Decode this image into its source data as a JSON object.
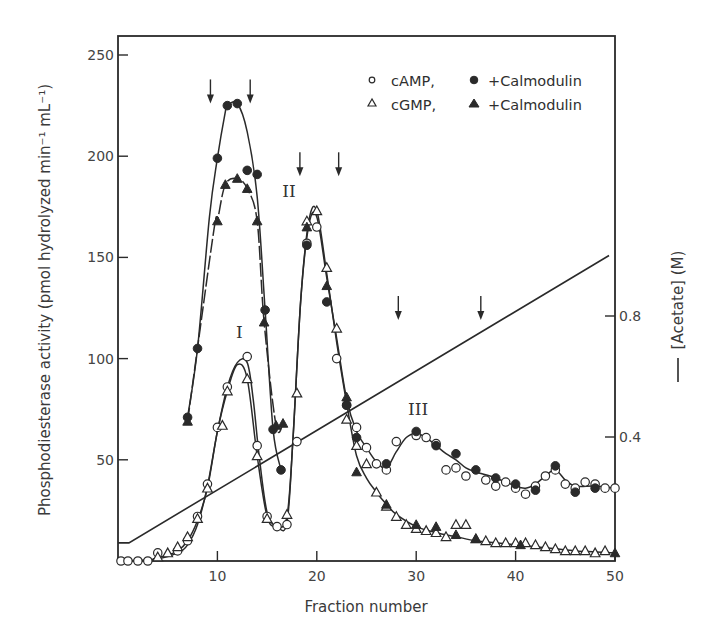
{
  "chart_data": {
    "type": "scatter",
    "title": "",
    "xlabel": "Fraction number",
    "ylabel": "Phosphodiesterase activity (pmol hydrolyzed min⁻¹ mL⁻¹)",
    "y2label": "[Acetate] (M)",
    "xlim": [
      0,
      50
    ],
    "ylim": [
      0,
      260
    ],
    "y2lim": [
      0,
      1.03
    ],
    "grid": false,
    "x_ticks": [
      10,
      20,
      30,
      40,
      50
    ],
    "x_tick_labels": [
      "10",
      "20",
      "30",
      "40",
      "50"
    ],
    "y_ticks": [
      50,
      100,
      150,
      200,
      250
    ],
    "y_tick_labels": [
      "50",
      "100",
      "150",
      "200",
      "250"
    ],
    "y2_ticks": [
      0.4,
      0.8
    ],
    "y2_tick_labels": [
      "0.4",
      "0.8"
    ],
    "legend": {
      "placement": "top-right",
      "rows": [
        {
          "open_symbol": "circle",
          "open_label": "cAMP,",
          "filled_symbol": "circle",
          "filled_label": "+Calmodulin"
        },
        {
          "open_symbol": "triangle",
          "open_label": "cGMP,",
          "filled_symbol": "triangle",
          "filled_label": "+Calmodulin"
        }
      ]
    },
    "peak_labels": [
      {
        "text": "I",
        "x": 12.2,
        "y": 110
      },
      {
        "text": "II",
        "x": 17.2,
        "y": 180
      },
      {
        "text": "III",
        "x": 30.2,
        "y": 72
      }
    ],
    "pooling_arrows": [
      {
        "x": 9.3,
        "y": 232
      },
      {
        "x": 13.3,
        "y": 232
      },
      {
        "x": 18.3,
        "y": 196
      },
      {
        "x": 22.2,
        "y": 196
      },
      {
        "x": 28.2,
        "y": 125
      },
      {
        "x": 36.5,
        "y": 125
      }
    ],
    "series": [
      {
        "name": "cAMP",
        "marker": "circle",
        "filled": false,
        "points": [
          [
            0.3,
            0
          ],
          [
            1,
            0
          ],
          [
            2,
            0
          ],
          [
            3,
            0
          ],
          [
            4,
            4
          ],
          [
            6,
            5
          ],
          [
            7,
            10
          ],
          [
            8,
            22
          ],
          [
            9,
            38
          ],
          [
            10,
            66
          ],
          [
            11,
            86
          ],
          [
            13,
            101
          ],
          [
            14,
            57
          ],
          [
            15,
            22
          ],
          [
            16,
            17
          ],
          [
            17,
            18
          ],
          [
            18,
            59
          ],
          [
            19,
            157
          ],
          [
            20,
            165
          ],
          [
            22,
            100
          ],
          [
            23,
            77
          ],
          [
            24,
            66
          ],
          [
            25,
            56
          ],
          [
            26,
            48
          ],
          [
            27,
            45
          ],
          [
            28,
            59
          ],
          [
            30,
            62
          ],
          [
            31,
            61
          ],
          [
            32,
            58
          ],
          [
            33,
            45
          ],
          [
            34,
            46
          ],
          [
            35,
            42
          ],
          [
            37,
            40
          ],
          [
            38,
            37
          ],
          [
            39,
            39
          ],
          [
            40,
            36
          ],
          [
            41,
            33
          ],
          [
            42,
            37
          ],
          [
            43,
            42
          ],
          [
            44,
            45
          ],
          [
            45,
            38
          ],
          [
            46,
            36
          ],
          [
            47,
            39
          ],
          [
            48,
            38
          ],
          [
            49,
            36
          ],
          [
            50,
            36
          ]
        ]
      },
      {
        "name": "cAMP + Calmodulin",
        "marker": "circle",
        "filled": true,
        "points": [
          [
            7,
            71
          ],
          [
            8,
            105
          ],
          [
            10,
            199
          ],
          [
            11,
            225
          ],
          [
            12,
            226
          ],
          [
            13,
            193
          ],
          [
            14,
            191
          ],
          [
            14.8,
            124
          ],
          [
            15.6,
            65
          ],
          [
            16.4,
            45
          ],
          [
            19,
            156
          ],
          [
            21,
            128
          ],
          [
            23,
            77
          ],
          [
            24,
            61
          ],
          [
            27,
            48
          ],
          [
            30,
            64
          ],
          [
            32,
            57
          ],
          [
            34,
            53
          ],
          [
            36,
            45
          ],
          [
            38,
            41
          ],
          [
            40,
            38
          ],
          [
            42,
            35
          ],
          [
            44,
            47
          ],
          [
            46,
            34
          ],
          [
            48,
            36
          ]
        ]
      },
      {
        "name": "cGMP",
        "marker": "triangle",
        "filled": false,
        "points": [
          [
            4,
            2
          ],
          [
            5,
            4
          ],
          [
            6,
            7
          ],
          [
            7,
            12
          ],
          [
            8,
            21
          ],
          [
            9,
            36
          ],
          [
            10.5,
            67
          ],
          [
            11,
            84
          ],
          [
            13,
            90
          ],
          [
            14,
            52
          ],
          [
            15,
            21
          ],
          [
            17,
            23
          ],
          [
            18,
            83
          ],
          [
            19,
            168
          ],
          [
            20,
            173
          ],
          [
            21,
            145
          ],
          [
            22,
            115
          ],
          [
            23,
            70
          ],
          [
            24,
            57
          ],
          [
            25,
            48
          ],
          [
            26,
            34
          ],
          [
            27,
            27
          ],
          [
            28,
            22
          ],
          [
            29,
            18
          ],
          [
            30,
            16
          ],
          [
            31,
            15
          ],
          [
            32,
            14
          ],
          [
            33,
            12
          ],
          [
            34,
            18
          ],
          [
            35,
            18
          ],
          [
            36,
            11
          ],
          [
            37,
            10
          ],
          [
            38,
            9
          ],
          [
            39,
            9
          ],
          [
            40,
            9
          ],
          [
            41,
            9
          ],
          [
            42,
            8
          ],
          [
            43,
            7
          ],
          [
            44,
            6
          ],
          [
            45,
            5
          ],
          [
            46,
            5
          ],
          [
            47,
            5
          ],
          [
            48,
            4
          ],
          [
            49,
            5
          ]
        ]
      },
      {
        "name": "cGMP + Calmodulin",
        "marker": "triangle",
        "filled": true,
        "points": [
          [
            7,
            69
          ],
          [
            10,
            168
          ],
          [
            10.8,
            186
          ],
          [
            12,
            189
          ],
          [
            13,
            184
          ],
          [
            14,
            168
          ],
          [
            14.7,
            118
          ],
          [
            15.9,
            67
          ],
          [
            16.6,
            68
          ],
          [
            19,
            165
          ],
          [
            21,
            136
          ],
          [
            23,
            81
          ],
          [
            24,
            44
          ],
          [
            27,
            28
          ],
          [
            30,
            18
          ],
          [
            32,
            17
          ],
          [
            34,
            13
          ],
          [
            36,
            11
          ],
          [
            40.5,
            8
          ],
          [
            50,
            4
          ]
        ]
      }
    ],
    "curves": {
      "camp": [
        [
          0,
          0
        ],
        [
          4,
          1
        ],
        [
          6,
          4
        ],
        [
          7,
          8
        ],
        [
          8,
          18
        ],
        [
          9,
          37
        ],
        [
          10,
          64
        ],
        [
          11,
          86
        ],
        [
          12,
          98
        ],
        [
          13,
          98
        ],
        [
          13.6,
          80
        ],
        [
          14.2,
          52
        ],
        [
          15,
          24
        ],
        [
          16,
          17
        ],
        [
          17,
          19
        ],
        [
          17.6,
          60
        ],
        [
          18.4,
          130
        ],
        [
          19.2,
          166
        ],
        [
          20,
          170
        ],
        [
          21,
          140
        ],
        [
          22,
          110
        ],
        [
          23,
          80
        ],
        [
          24,
          64
        ],
        [
          25,
          56
        ],
        [
          26,
          49
        ],
        [
          27,
          46
        ],
        [
          28,
          54
        ],
        [
          29,
          61
        ],
        [
          30,
          63
        ],
        [
          31,
          61
        ],
        [
          32,
          57
        ],
        [
          33,
          53
        ],
        [
          34,
          50
        ],
        [
          35,
          46
        ],
        [
          36,
          44
        ],
        [
          38,
          41
        ],
        [
          40,
          37
        ],
        [
          41,
          36
        ],
        [
          42,
          38
        ],
        [
          43,
          42
        ],
        [
          44,
          45
        ],
        [
          45,
          40
        ],
        [
          46,
          37
        ],
        [
          48,
          37
        ],
        [
          50,
          36
        ]
      ],
      "cgmp": [
        [
          3.5,
          1
        ],
        [
          5,
          3
        ],
        [
          6,
          5
        ],
        [
          7,
          10
        ],
        [
          8,
          20
        ],
        [
          9,
          36
        ],
        [
          10,
          64
        ],
        [
          11,
          84
        ],
        [
          12,
          97
        ],
        [
          13,
          90
        ],
        [
          14,
          52
        ],
        [
          15,
          22
        ],
        [
          16,
          17
        ],
        [
          17,
          22
        ],
        [
          17.6,
          60
        ],
        [
          18.4,
          130
        ],
        [
          19.2,
          168
        ],
        [
          20,
          173
        ],
        [
          21,
          142
        ],
        [
          22,
          108
        ],
        [
          23,
          78
        ],
        [
          24,
          52
        ],
        [
          25,
          41
        ],
        [
          26,
          34
        ],
        [
          27,
          28
        ],
        [
          28,
          23
        ],
        [
          30,
          17
        ],
        [
          32,
          14
        ],
        [
          34,
          12
        ],
        [
          36,
          10
        ],
        [
          38,
          9
        ],
        [
          40,
          8
        ],
        [
          42,
          7
        ],
        [
          44,
          6
        ],
        [
          46,
          5
        ],
        [
          48,
          4.5
        ],
        [
          50,
          4
        ]
      ],
      "camp_cal": [
        [
          7,
          71
        ],
        [
          8,
          105
        ],
        [
          9.2,
          170
        ],
        [
          10,
          199
        ],
        [
          10.8,
          222
        ],
        [
          11,
          225
        ],
        [
          12,
          226
        ],
        [
          13,
          212
        ],
        [
          14,
          180
        ],
        [
          14.8,
          124
        ],
        [
          15.6,
          65
        ],
        [
          16.4,
          45
        ]
      ],
      "cgmp_cal": [
        [
          7,
          69
        ],
        [
          9.6,
          162
        ],
        [
          10,
          168
        ],
        [
          10.8,
          186
        ],
        [
          12,
          189
        ],
        [
          13,
          184
        ],
        [
          14,
          168
        ],
        [
          14.7,
          118
        ],
        [
          15.9,
          67
        ],
        [
          16.6,
          68
        ]
      ]
    },
    "acetate": {
      "points": [
        [
          0,
          0.05
        ],
        [
          1.1,
          0.05
        ],
        [
          49.4,
          1.0
        ]
      ]
    }
  },
  "colors": {
    "ink": "#2a2a2a",
    "background": "#ffffff"
  }
}
